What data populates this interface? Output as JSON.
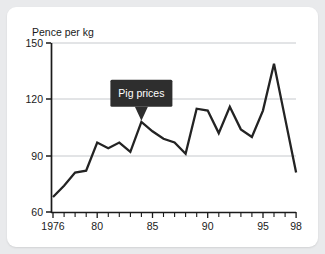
{
  "chart_data": {
    "type": "line",
    "title": "",
    "ylabel": "Pence per kg",
    "xlabel": "",
    "ylim": [
      60,
      150
    ],
    "xlim": [
      1976,
      1998
    ],
    "yticks": [
      60,
      90,
      120,
      150
    ],
    "ytick_labels": [
      "60",
      "90",
      "120",
      "150"
    ],
    "xticks": [
      1976,
      1980,
      1985,
      1990,
      1995,
      1998
    ],
    "xtick_labels": [
      "1976",
      "80",
      "85",
      "90",
      "95",
      "98"
    ],
    "grid": "horizontal",
    "legend": "none",
    "line_color": "#232323",
    "x": [
      1976,
      1977,
      1978,
      1979,
      1980,
      1981,
      1982,
      1983,
      1984,
      1985,
      1986,
      1987,
      1988,
      1989,
      1990,
      1991,
      1992,
      1993,
      1994,
      1995,
      1996,
      1997,
      1998
    ],
    "values": [
      68,
      74,
      81,
      82,
      97,
      94,
      97,
      92,
      108,
      103,
      99,
      97,
      91,
      115,
      114,
      102,
      116,
      104,
      100,
      114,
      139,
      110,
      81
    ],
    "series": [
      {
        "name": "Pig prices",
        "values": [
          68,
          74,
          81,
          82,
          97,
          94,
          97,
          92,
          108,
          103,
          99,
          97,
          91,
          115,
          114,
          102,
          116,
          104,
          100,
          114,
          139,
          110,
          81
        ]
      }
    ],
    "annotations": [
      {
        "label": "Pig prices",
        "points_to_x": 1984,
        "points_to_y": 108,
        "style": "dark-callout"
      }
    ]
  },
  "colors": {
    "page_background": "#e9eaec",
    "card_background": "#ffffff",
    "line": "#232323",
    "gridline": "#bfc3c7",
    "axis": "#1a1a1a",
    "callout_background": "#2e2e2e",
    "callout_text": "#ffffff"
  }
}
